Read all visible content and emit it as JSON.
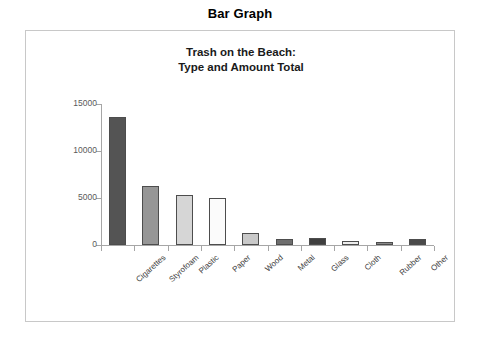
{
  "page": {
    "title": "Bar Graph"
  },
  "chart_data": {
    "type": "bar",
    "title": "Trash on the Beach:\nType and Amount Total",
    "title_lines": [
      "Trash on the Beach:",
      "Type and Amount Total"
    ],
    "xlabel": "",
    "ylabel": "",
    "categories": [
      "Cigarettes",
      "Styrofoam",
      "Plastic",
      "Paper",
      "Wood",
      "Metal",
      "Glass",
      "Cloth",
      "Rubber",
      "Other"
    ],
    "values": [
      13600,
      6300,
      5300,
      5000,
      1250,
      650,
      700,
      400,
      300,
      600
    ],
    "bar_colors": [
      "#545454",
      "#969696",
      "#d6d6d6",
      "#fbfbfb",
      "#c9c9c9",
      "#6e6e6e",
      "#3f3f3f",
      "#ededed",
      "#8a8a8a",
      "#4a4a4a"
    ],
    "ylim": [
      0,
      15000
    ],
    "yticks": [
      0,
      5000,
      10000,
      15000
    ],
    "ytick_labels": [
      "0",
      "5000",
      "10000",
      "15000"
    ],
    "grid": false,
    "legend": false
  }
}
